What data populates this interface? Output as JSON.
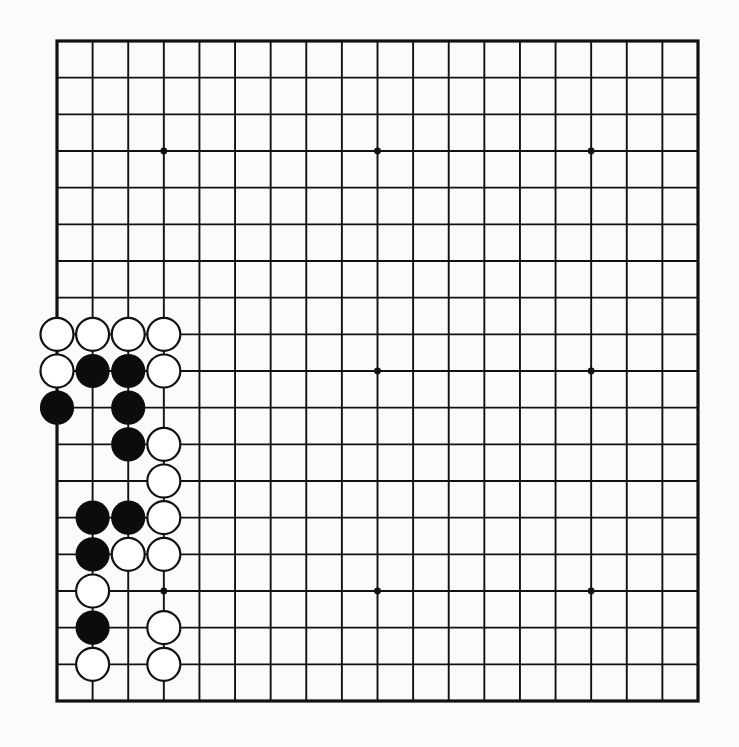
{
  "board": {
    "size": 19,
    "origin_x": 57,
    "origin_y": 41,
    "width": 641,
    "height": 660,
    "line_color": "#111111",
    "background": "#fbfbfa",
    "border_width": 3.2,
    "line_width": 1.9,
    "stone_radius": 16.5,
    "star_points": [
      [
        3,
        3
      ],
      [
        9,
        3
      ],
      [
        15,
        3
      ],
      [
        3,
        9
      ],
      [
        9,
        9
      ],
      [
        15,
        9
      ],
      [
        3,
        15
      ],
      [
        9,
        15
      ],
      [
        15,
        15
      ]
    ],
    "star_radius": 3.4
  },
  "stones": [
    {
      "col": 0,
      "row": 8,
      "color": "white"
    },
    {
      "col": 1,
      "row": 8,
      "color": "white"
    },
    {
      "col": 2,
      "row": 8,
      "color": "white"
    },
    {
      "col": 3,
      "row": 8,
      "color": "white"
    },
    {
      "col": 0,
      "row": 9,
      "color": "white"
    },
    {
      "col": 1,
      "row": 9,
      "color": "black"
    },
    {
      "col": 2,
      "row": 9,
      "color": "black"
    },
    {
      "col": 3,
      "row": 9,
      "color": "white"
    },
    {
      "col": 0,
      "row": 10,
      "color": "black"
    },
    {
      "col": 2,
      "row": 10,
      "color": "black"
    },
    {
      "col": 2,
      "row": 11,
      "color": "black"
    },
    {
      "col": 3,
      "row": 11,
      "color": "white"
    },
    {
      "col": 3,
      "row": 12,
      "color": "white"
    },
    {
      "col": 1,
      "row": 13,
      "color": "black"
    },
    {
      "col": 2,
      "row": 13,
      "color": "black"
    },
    {
      "col": 3,
      "row": 13,
      "color": "white"
    },
    {
      "col": 1,
      "row": 14,
      "color": "black"
    },
    {
      "col": 2,
      "row": 14,
      "color": "white"
    },
    {
      "col": 3,
      "row": 14,
      "color": "white"
    },
    {
      "col": 1,
      "row": 15,
      "color": "white"
    },
    {
      "col": 1,
      "row": 16,
      "color": "black"
    },
    {
      "col": 3,
      "row": 16,
      "color": "white"
    },
    {
      "col": 1,
      "row": 17,
      "color": "white"
    },
    {
      "col": 3,
      "row": 17,
      "color": "white"
    }
  ],
  "colors": {
    "black_stone": "#0c0c0c",
    "white_stone_fill": "#ffffff",
    "white_stone_stroke": "#111111"
  }
}
